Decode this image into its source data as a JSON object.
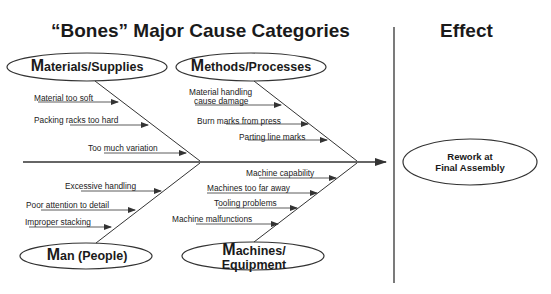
{
  "titles": {
    "main": "“Bones” Major Cause Categories",
    "effect_header": "Effect"
  },
  "categories": [
    {
      "id": "materials",
      "first_letter": "M",
      "rest": "aterials/Supplies",
      "causes": [
        "Material too soft",
        "Packing racks too hard",
        "Too much variation"
      ]
    },
    {
      "id": "methods",
      "first_letter": "M",
      "rest": "ethods/Processes",
      "causes": [
        "Material handling",
        "cause damage",
        "Burn marks from press",
        "Parting line marks"
      ]
    },
    {
      "id": "man",
      "first_letter": "M",
      "rest": "an (People)",
      "causes": [
        "Excessive handling",
        "Poor attention to detail",
        "Improper stacking"
      ]
    },
    {
      "id": "machines",
      "first_letter": "M",
      "rest_line1": "achines/",
      "line2": "Equipment",
      "causes": [
        "Machine capability",
        "Machines too far away",
        "Tooling problems",
        "Machine malfunctions"
      ]
    }
  ],
  "effect": {
    "line1": "Rework at",
    "line2": "Final Assembly"
  },
  "colors": {
    "line": "#333333",
    "text": "#1a1a1a",
    "background": "#ffffff"
  }
}
